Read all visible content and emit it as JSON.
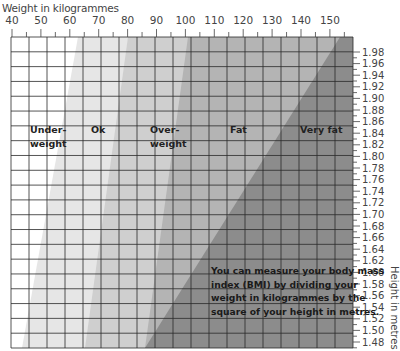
{
  "chart_data": {
    "type": "heatmap",
    "title": "",
    "xlabel": "Weight in kilogrammes",
    "ylabel": "Height in metres",
    "x_ticks": [
      40,
      50,
      60,
      70,
      80,
      90,
      100,
      110,
      120,
      130,
      140,
      150
    ],
    "xlim": [
      40,
      158
    ],
    "y_ticks": [
      "1.98",
      "1.96",
      "1.94",
      "1.92",
      "1.90",
      "1.88",
      "1.86",
      "1.84",
      "1.82",
      "1.80",
      "1.78",
      "1.76",
      "1.74",
      "1.72",
      "1.70",
      "1.68",
      "1.66",
      "1.64",
      "1.62",
      "1.60",
      "1.58",
      "1.56",
      "1.54",
      "1.52",
      "1.50",
      "1.48"
    ],
    "ylim": [
      1.47,
      2.0
    ],
    "grid": true,
    "bands": [
      {
        "label": "Under-\nweight",
        "lines": [
          "Under-",
          "weight"
        ],
        "color": "#ffffff"
      },
      {
        "label": "Ok",
        "lines": [
          "Ok"
        ],
        "color": "#e6e6e6"
      },
      {
        "label": "Over-\nweight",
        "lines": [
          "Over-",
          "weight"
        ],
        "color": "#cfcfcf"
      },
      {
        "label": "Fat",
        "lines": [
          "Fat"
        ],
        "color": "#b4b4b4"
      },
      {
        "label": "Very fat",
        "lines": [
          "Very fat"
        ],
        "color": "#8c8c8c"
      }
    ],
    "annotation": "You can measure your body mass index (BMI) by dividing your weight in kilogrammes by the square of your height in metres."
  },
  "labels": {
    "xlabel": "Weight in kilogrammes",
    "ylabel": "Height in metres",
    "note_lines": [
      "You can measure your body mass",
      "index (BMI) by dividing your",
      "weight in kilogrammes by the",
      "square of your height in metres."
    ]
  }
}
